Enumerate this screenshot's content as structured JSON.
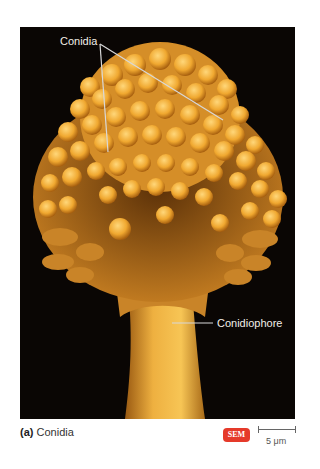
{
  "figure": {
    "labels": {
      "conidia": "Conidia",
      "conidiophore": "Conidiophore"
    },
    "caption": {
      "part": "(a)",
      "text": "Conidia"
    },
    "badge": "SEM",
    "scale_bar": "5 μm",
    "colors": {
      "background": "#0a0604",
      "spore": "#f0a830",
      "stalk": "#e8a030",
      "badge": "#e53a2a"
    }
  }
}
